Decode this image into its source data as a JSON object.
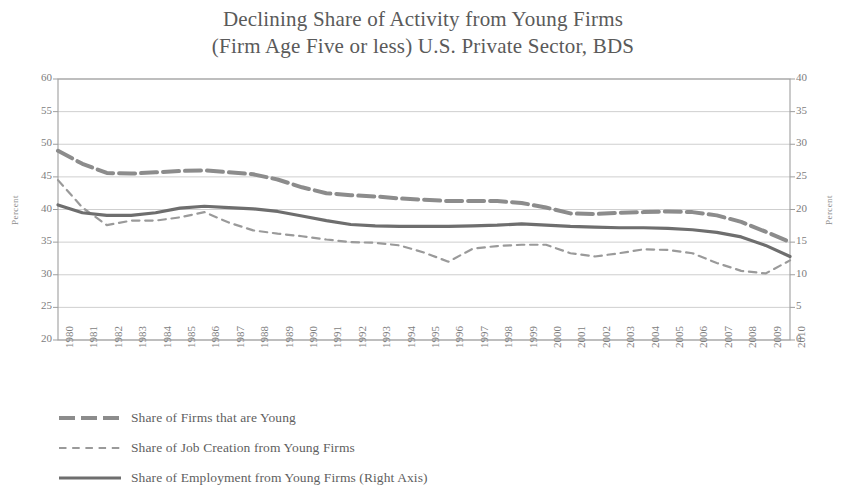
{
  "chart_data": {
    "type": "line",
    "title": "Declining Share of Activity from Young Firms (Firm Age Five or less) U.S. Private Sector, BDS",
    "title_lines": [
      "Declining Share of Activity from Young Firms",
      "(Firm Age Five or less) U.S. Private Sector, BDS"
    ],
    "xlabel": "",
    "ylabel": "Percent",
    "ylabel_right": "Percent",
    "ylim": [
      20,
      60
    ],
    "yticks": [
      60,
      55,
      50,
      45,
      40,
      35,
      30,
      25,
      20
    ],
    "ylim_right": [
      0,
      40
    ],
    "yticks_right": [
      40,
      35,
      30,
      25,
      20,
      15,
      10,
      5,
      0
    ],
    "grid": true,
    "legend_position": "below",
    "x": [
      "1980",
      "1981",
      "1982",
      "1983",
      "1984",
      "1985",
      "1986",
      "1987",
      "1988",
      "1989",
      "1990",
      "1991",
      "1992",
      "1993",
      "1994",
      "1995",
      "1996",
      "1997",
      "1998",
      "1999",
      "2000",
      "2001",
      "2002",
      "2003",
      "2004",
      "2005",
      "2006",
      "2007",
      "2008",
      "2009",
      "2010"
    ],
    "series": [
      {
        "name": "Share of Firms that are Young",
        "axis": "left",
        "style": "long-dash",
        "color": "#8c8c8c",
        "width": 4.0,
        "values": [
          49.0,
          47.0,
          45.6,
          45.5,
          45.7,
          45.9,
          46.0,
          45.7,
          45.4,
          44.6,
          43.4,
          42.5,
          42.2,
          42.0,
          41.7,
          41.5,
          41.3,
          41.3,
          41.3,
          41.0,
          40.3,
          39.4,
          39.3,
          39.5,
          39.6,
          39.7,
          39.6,
          39.1,
          38.1,
          36.6,
          35.0
        ]
      },
      {
        "name": "Share of Job Creation from Young Firms",
        "axis": "left",
        "style": "short-dash",
        "color": "#9a9a9a",
        "width": 2.2,
        "values": [
          44.5,
          40.3,
          37.6,
          38.3,
          38.3,
          38.8,
          39.6,
          38.0,
          36.8,
          36.3,
          35.9,
          35.4,
          35.0,
          34.9,
          34.5,
          33.4,
          32.0,
          34.0,
          34.4,
          34.6,
          34.6,
          33.3,
          32.8,
          33.3,
          33.9,
          33.8,
          33.3,
          31.8,
          30.6,
          30.2,
          32.2
        ]
      },
      {
        "name": "Share of Employment from Young Firms (Right Axis)",
        "axis": "right",
        "style": "solid",
        "color": "#6e6e6e",
        "width": 3.2,
        "values": [
          20.7,
          19.5,
          19.1,
          19.1,
          19.5,
          20.2,
          20.5,
          20.3,
          20.1,
          19.7,
          19.0,
          18.3,
          17.7,
          17.5,
          17.4,
          17.4,
          17.4,
          17.5,
          17.6,
          17.8,
          17.6,
          17.4,
          17.3,
          17.2,
          17.2,
          17.1,
          16.9,
          16.5,
          15.8,
          14.5,
          12.8
        ]
      }
    ]
  },
  "legend": {
    "items": [
      {
        "label": "Share of Firms that are Young"
      },
      {
        "label": "Share of Job Creation from Young Firms"
      },
      {
        "label": "Share of Employment from Young Firms (Right Axis)"
      }
    ]
  }
}
